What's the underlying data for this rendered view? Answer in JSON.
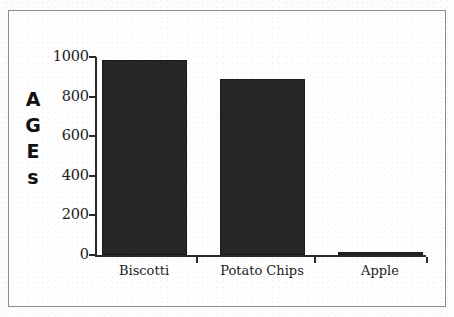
{
  "figure": {
    "background_color": "#fdfdfc",
    "frame_color": "#8c8c8c",
    "bar_color": "#262626",
    "axis_color": "#2a2a2a"
  },
  "chart_data": {
    "type": "bar",
    "title": "",
    "subtitle": "",
    "xlabel": "",
    "ylabel": "AGES",
    "ylabel_stacked": [
      "A",
      "G",
      "E",
      "s"
    ],
    "categories": [
      "Biscotti",
      "Potato Chips",
      "Apple"
    ],
    "values": [
      985,
      890,
      15
    ],
    "series": [
      {
        "name": "AGES",
        "values": [
          985,
          890,
          15
        ]
      }
    ],
    "ylim": [
      0,
      1000
    ],
    "yticks": [
      0,
      200,
      400,
      600,
      800,
      1000
    ],
    "ytick_labels": [
      "0",
      "200",
      "400",
      "600",
      "800",
      "1000"
    ],
    "grid": false,
    "legend": false,
    "legend_position": "none",
    "orientation": "vertical",
    "annotations": []
  }
}
